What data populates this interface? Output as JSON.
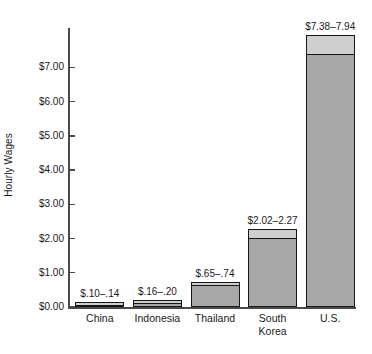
{
  "chart_data": {
    "type": "bar",
    "title": "",
    "xlabel": "",
    "ylabel": "Hourly Wages",
    "categories": [
      "China",
      "Indonesia",
      "Thailand",
      "South\nKorea",
      "U.S."
    ],
    "category_labels_flat": [
      "China",
      "Indonesia",
      "Thailand",
      "South Korea",
      "U.S."
    ],
    "value_labels": [
      "$.10–.14",
      "$.16–.20",
      "$.65–.74",
      "$2.02–2.27",
      "$7.38–7.94"
    ],
    "low_values": [
      0.1,
      0.16,
      0.65,
      2.02,
      7.38
    ],
    "high_values": [
      0.14,
      0.2,
      0.74,
      2.27,
      7.94
    ],
    "values": [
      0.14,
      0.2,
      0.74,
      2.27,
      7.94
    ],
    "ylim": [
      0,
      8.15
    ],
    "ytick_values": [
      0,
      1,
      2,
      3,
      4,
      5,
      6,
      7
    ],
    "ytick_labels": [
      "$0.00",
      "$1.00",
      "$2.00",
      "$3.00",
      "$4.00",
      "$5.00",
      "$6.00",
      "$7.00"
    ],
    "grid": false,
    "legend": "none",
    "colors": {
      "bar_low_fill": "#a8a8a8",
      "bar_range_fill": "#cfcfcf",
      "bar_outline": "#161616",
      "axis": "#4a4a4a",
      "text": "#1a1a1a",
      "background": "#ffffff"
    }
  }
}
